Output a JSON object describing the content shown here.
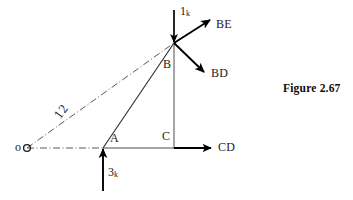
{
  "figure": {
    "caption": "Figure 2.67",
    "caption_position": {
      "x": 283,
      "y": 82
    },
    "canvas": {
      "width": 353,
      "height": 200
    },
    "background_color": "#ffffff",
    "line_color": "#1a1a1a",
    "accent_color": "#000000"
  },
  "points": [
    {
      "id": "O",
      "label": "o",
      "x": 27,
      "y": 148,
      "label_x": 15,
      "label_y": 143,
      "marker": "circle"
    },
    {
      "id": "A",
      "label": "A",
      "x": 103,
      "y": 148,
      "label_x": 110,
      "label_y": 134,
      "marker": "none"
    },
    {
      "id": "B",
      "label": "B",
      "x": 174,
      "y": 43,
      "label_x": 163,
      "label_y": 60,
      "marker": "none"
    },
    {
      "id": "C",
      "label": "C",
      "x": 174,
      "y": 148,
      "label_x": 162,
      "label_y": 132,
      "marker": "none"
    }
  ],
  "members": [
    {
      "id": "AB",
      "from": "A",
      "to": "B",
      "style": "solid"
    },
    {
      "id": "BC",
      "from": "B",
      "to": "C",
      "style": "solid"
    },
    {
      "id": "AC",
      "from": "A",
      "to": "C",
      "style": "solid"
    }
  ],
  "dimension": {
    "id": "OB",
    "label": "12",
    "style": "dash-dot",
    "from": {
      "x": 27,
      "y": 148
    },
    "to": {
      "x": 174,
      "y": 43
    },
    "label_x": 62,
    "label_y": 108
  },
  "baseline": {
    "id": "OA",
    "style": "dash-dot",
    "from": {
      "x": 27,
      "y": 148
    },
    "to": {
      "x": 103,
      "y": 148
    }
  },
  "forces": [
    {
      "id": "load-1k",
      "label": "1",
      "subscript": "k",
      "value": 1,
      "unit": "k",
      "direction": "down",
      "applied_at": "B",
      "tail": {
        "x": 174,
        "y": 10
      },
      "head": {
        "x": 174,
        "y": 43
      },
      "label_x": 180,
      "label_y": 6
    },
    {
      "id": "load-3k",
      "label": "3",
      "subscript": "k",
      "value": 3,
      "unit": "k",
      "direction": "up",
      "applied_at": "A",
      "tail": {
        "x": 103,
        "y": 191
      },
      "head": {
        "x": 103,
        "y": 148
      },
      "label_x": 108,
      "label_y": 168
    }
  ],
  "member_forces": [
    {
      "id": "force-BE",
      "label": "BE",
      "origin": "B",
      "direction": "up-right",
      "tail": {
        "x": 174,
        "y": 43
      },
      "head": {
        "x": 211,
        "y": 19
      },
      "label_x": 216,
      "label_y": 20
    },
    {
      "id": "force-BD",
      "label": "BD",
      "origin": "B",
      "direction": "down-right",
      "tail": {
        "x": 174,
        "y": 43
      },
      "head": {
        "x": 205,
        "y": 73
      },
      "label_x": 211,
      "label_y": 69
    },
    {
      "id": "force-CD",
      "label": "CD",
      "origin": "C",
      "direction": "right",
      "tail": {
        "x": 174,
        "y": 148
      },
      "head": {
        "x": 212,
        "y": 148
      },
      "label_x": 218,
      "label_y": 142
    }
  ]
}
